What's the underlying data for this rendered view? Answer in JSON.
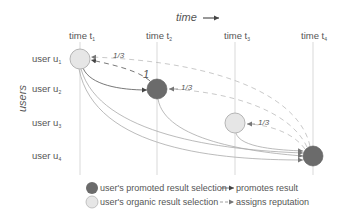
{
  "axis": {
    "time_label": "time",
    "users_label": "users"
  },
  "time_columns": [
    {
      "label": "time t",
      "sub": "1",
      "x": 80
    },
    {
      "label": "time t",
      "sub": "2",
      "x": 157
    },
    {
      "label": "time t",
      "sub": "3",
      "x": 235
    },
    {
      "label": "time t",
      "sub": "4",
      "x": 313
    }
  ],
  "user_rows": [
    {
      "label": "user u",
      "sub": "1",
      "y": 59
    },
    {
      "label": "user u",
      "sub": "2",
      "y": 89
    },
    {
      "label": "user u",
      "sub": "3",
      "y": 123
    },
    {
      "label": "user u",
      "sub": "4",
      "y": 156
    }
  ],
  "nodes": [
    {
      "user": "u1",
      "time": "t1",
      "type": "organic"
    },
    {
      "user": "u2",
      "time": "t2",
      "type": "promoted"
    },
    {
      "user": "u3",
      "time": "t3",
      "type": "organic"
    },
    {
      "user": "u4",
      "time": "t4",
      "type": "promoted"
    }
  ],
  "edge_labels": {
    "u2_to_u1": "1",
    "u4_to_u1": "1/3",
    "u4_to_u2": "1/3",
    "u4_to_u3": "1/3"
  },
  "legend": {
    "promoted_selection": "user's promoted result selection",
    "organic_selection": "user's organic result selection",
    "promotes_result": "promotes result",
    "assigns_reputation": "assigns reputation"
  },
  "colors": {
    "promoted_fill": "#6b6b6b",
    "organic_fill": "#e6e6e6",
    "line": "#999999",
    "grid": "#cfcfcf"
  }
}
